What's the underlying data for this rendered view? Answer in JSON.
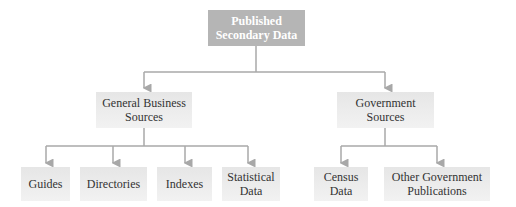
{
  "diagram": {
    "root": {
      "label": "Published\nSecondary Data"
    },
    "branches": [
      {
        "label": "General Business\nSources",
        "children": [
          {
            "label": "Guides"
          },
          {
            "label": "Directories"
          },
          {
            "label": "Indexes"
          },
          {
            "label": "Statistical\nData"
          }
        ]
      },
      {
        "label": "Government\nSources",
        "children": [
          {
            "label": "Census\nData"
          },
          {
            "label": "Other Government\nPublications"
          }
        ]
      }
    ],
    "colors": {
      "root_fill": "#b5b5b5",
      "node_fill": "#eaeaea",
      "connector": "#a8a8a8",
      "root_text": "#ffffff",
      "node_text": "#333333"
    }
  }
}
